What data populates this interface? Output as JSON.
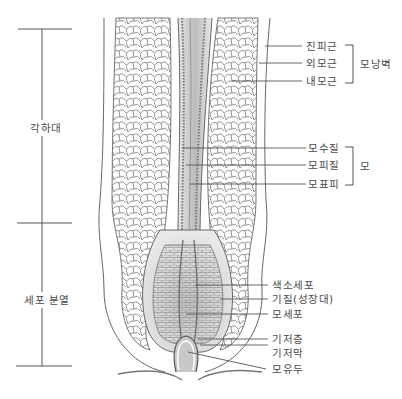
{
  "diagram": {
    "scale_regions": [
      {
        "id": "keratinization-zone",
        "label": "각하대"
      },
      {
        "id": "cell-division-zone",
        "label": "세포 분열"
      }
    ],
    "follicle_wall_group": {
      "bracket_label": "모낭벽",
      "items": [
        {
          "id": "connective-tissue-sheath",
          "label": "진피근"
        },
        {
          "id": "outer-root-sheath",
          "label": "외모근"
        },
        {
          "id": "inner-root-sheath",
          "label": "내모근"
        }
      ]
    },
    "hair_group": {
      "bracket_label": "모",
      "items": [
        {
          "id": "medulla",
          "label": "모수질"
        },
        {
          "id": "cortex",
          "label": "모피질"
        },
        {
          "id": "cuticle",
          "label": "모표피"
        }
      ]
    },
    "bulb_labels": [
      {
        "id": "melanocyte",
        "label": "색소세포"
      },
      {
        "id": "matrix",
        "label": "기질(성장대)"
      },
      {
        "id": "hair-cell",
        "label": "모세포"
      },
      {
        "id": "basal-layer",
        "label": "기저층"
      },
      {
        "id": "basement-membrane",
        "label": "기저막"
      },
      {
        "id": "dermal-papilla",
        "label": "모유두"
      }
    ],
    "colors": {
      "line": "#555555",
      "sketch": "#6a6a6a",
      "shade": "#bdbdbd",
      "background": "#ffffff"
    }
  }
}
